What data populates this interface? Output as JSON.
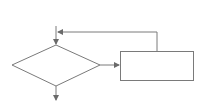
{
  "diagram": {
    "type": "flowchart-loop",
    "stroke_color": "#7a7a7a",
    "arrow_color": "#6a6a6a",
    "background": "#ffffff",
    "nodes": [
      {
        "id": "decision",
        "shape": "diamond",
        "label": "",
        "left": [
          12,
          65
        ],
        "top": [
          56,
          45
        ],
        "right": [
          100,
          65
        ],
        "bottom": [
          56,
          86
        ]
      },
      {
        "id": "process",
        "shape": "rectangle",
        "label": "",
        "x": 120,
        "y": 51,
        "width": 74,
        "height": 29
      }
    ],
    "edges": [
      {
        "id": "entry",
        "from": "top",
        "to": "decision",
        "label": ""
      },
      {
        "id": "decision-to-process",
        "from": "decision",
        "to": "process",
        "label": ""
      },
      {
        "id": "process-feedback",
        "from": "process",
        "to": "entry",
        "label": ""
      },
      {
        "id": "exit",
        "from": "decision",
        "to": "bottom",
        "label": ""
      }
    ]
  }
}
